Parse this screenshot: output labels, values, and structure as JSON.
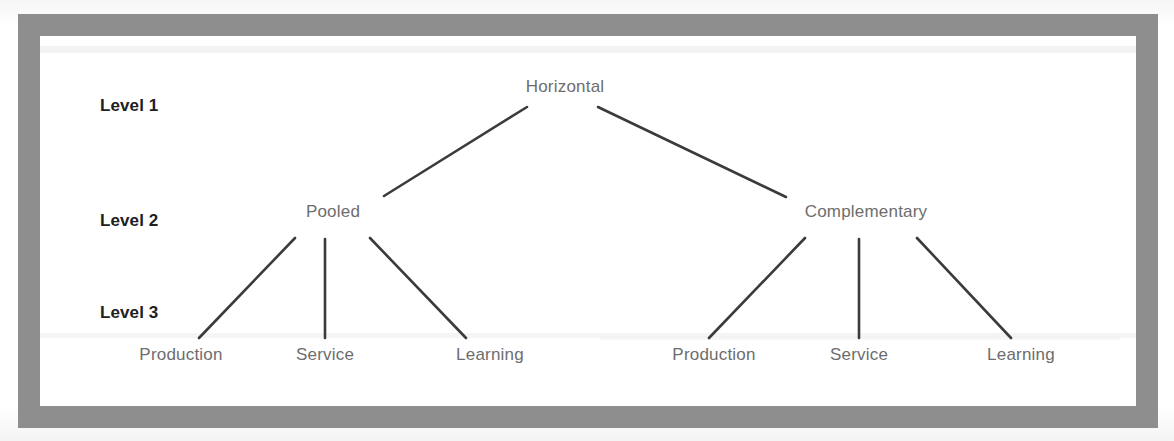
{
  "figure": {
    "type": "hierarchy-tree",
    "frame_color": "#8e8e8e",
    "edge_color": "#3b3b3b",
    "node_text_color": "#6d6d6d",
    "level_text_color": "#20201f",
    "background_color": "#ffffff"
  },
  "levels": [
    {
      "id": "level-1",
      "label": "Level 1"
    },
    {
      "id": "level-2",
      "label": "Level 2"
    },
    {
      "id": "level-3",
      "label": "Level 3"
    }
  ],
  "nodes": {
    "root": {
      "label": "Horizontal",
      "level": 1
    },
    "branch_left": {
      "label": "Pooled",
      "level": 2
    },
    "branch_right": {
      "label": "Complementary",
      "level": 2
    },
    "leaves_left": [
      {
        "label": "Production",
        "level": 3
      },
      {
        "label": "Service",
        "level": 3
      },
      {
        "label": "Learning",
        "level": 3
      }
    ],
    "leaves_right": [
      {
        "label": "Production",
        "level": 3
      },
      {
        "label": "Service",
        "level": 3
      },
      {
        "label": "Learning",
        "level": 3
      }
    ]
  },
  "edges": [
    {
      "from": "Horizontal",
      "to": "Pooled"
    },
    {
      "from": "Horizontal",
      "to": "Complementary"
    },
    {
      "from": "Pooled",
      "to": "Production"
    },
    {
      "from": "Pooled",
      "to": "Service"
    },
    {
      "from": "Pooled",
      "to": "Learning"
    },
    {
      "from": "Complementary",
      "to": "Production"
    },
    {
      "from": "Complementary",
      "to": "Service"
    },
    {
      "from": "Complementary",
      "to": "Learning"
    }
  ]
}
